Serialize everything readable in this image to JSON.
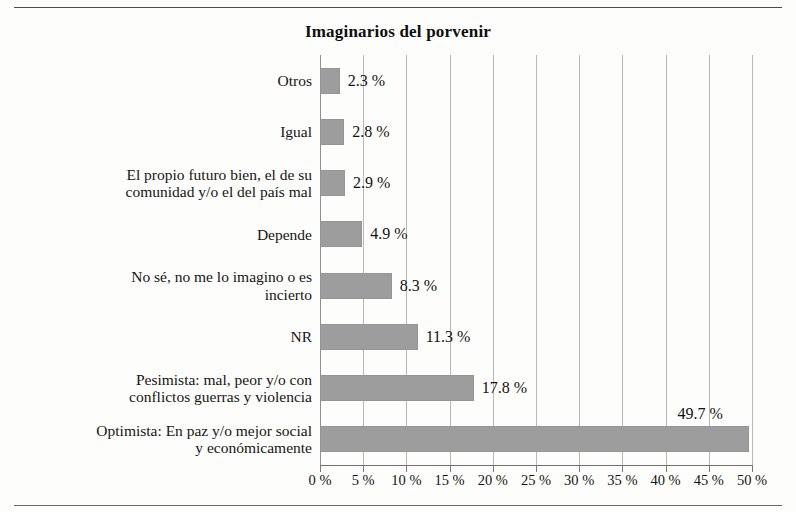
{
  "document": {
    "top_rule": "horizontal-rule",
    "bottom_rule": "horizontal-rule"
  },
  "chart_data": {
    "type": "bar",
    "orientation": "horizontal",
    "title": "Imaginarios del porvenir",
    "xlabel": "",
    "ylabel": "",
    "xlim": [
      0,
      50
    ],
    "xtick_step": 5,
    "grid": true,
    "legend": "none",
    "bar_color": "#9d9d9d",
    "categories": [
      "Otros",
      "Igual",
      "El propio futuro bien, el de su comunidad y/o el del país mal",
      "Depende",
      "No sé, no me lo imagino o es incierto",
      "NR",
      "Pesimista: mal, peor y/o con conflictos guerras y violencia",
      "Optimista: En paz y/o mejor social y económicamente"
    ],
    "category_lines": [
      [
        "Otros"
      ],
      [
        "Igual"
      ],
      [
        "El propio futuro bien, el de su",
        "comunidad y/o el del país mal"
      ],
      [
        "Depende"
      ],
      [
        "No sé, no me lo imagino o es",
        "incierto"
      ],
      [
        "NR"
      ],
      [
        "Pesimista: mal, peor y/o con",
        "conflictos guerras y violencia"
      ],
      [
        "Optimista: En paz y/o mejor social",
        "y económicamente"
      ]
    ],
    "values": [
      2.3,
      2.8,
      2.9,
      4.9,
      8.3,
      11.3,
      17.8,
      49.7
    ],
    "value_labels": [
      "2.3 %",
      "2.8 %",
      "2.9 %",
      "4.9 %",
      "8.3 %",
      "11.3 %",
      "17.8 %",
      "49.7 %"
    ],
    "xtick_values": [
      0,
      5,
      10,
      15,
      20,
      25,
      30,
      35,
      40,
      45,
      50
    ],
    "xtick_labels": [
      "0 %",
      "5 %",
      "10 %",
      "15 %",
      "20 %",
      "25 %",
      "30 %",
      "35 %",
      "40 %",
      "45 %",
      "50 %"
    ]
  }
}
